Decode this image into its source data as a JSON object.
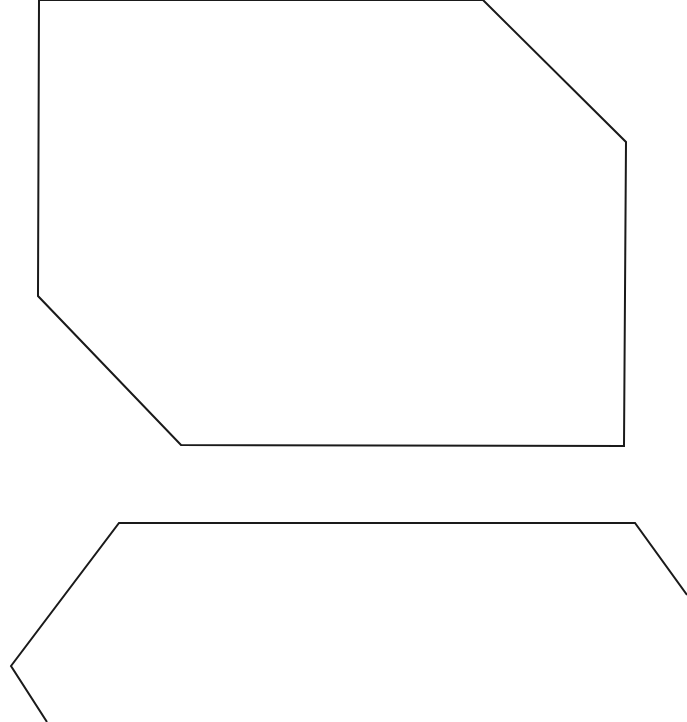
{
  "canvas": {
    "width": 687,
    "height": 722,
    "background": "#ffffff",
    "stroke_color": "#1a1a1a",
    "stroke_width": 2
  },
  "shapes": [
    {
      "name": "top-octagon-shape",
      "kind": "polygon",
      "points": "39,0 38,296 181,445 624,446 626,142 483,0"
    },
    {
      "name": "bottom-hexagon-shape",
      "kind": "polyline",
      "points": "47,722 11,666 119,523 635,523 687,595"
    }
  ]
}
